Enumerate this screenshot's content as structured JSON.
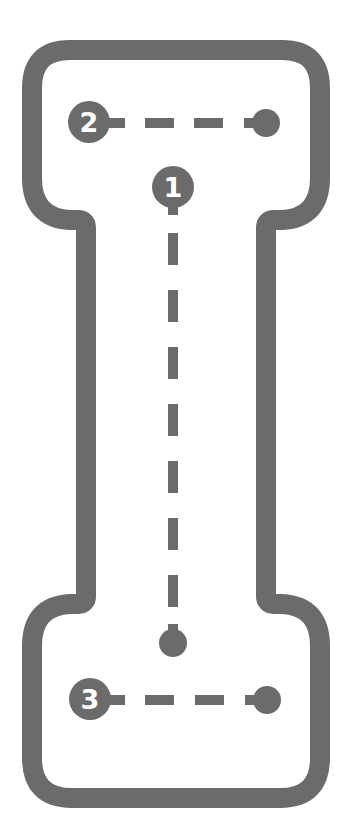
{
  "worksheet": {
    "letter": "I",
    "colors": {
      "outline": "#6b6b6b",
      "guide": "#6b6b6b",
      "marker_text": "#ffffff",
      "background": "#ffffff"
    },
    "strokes": [
      {
        "order": "1",
        "direction": "top-to-bottom",
        "label": "1"
      },
      {
        "order": "2",
        "direction": "left-to-right",
        "label": "2"
      },
      {
        "order": "3",
        "direction": "left-to-right",
        "label": "3"
      }
    ]
  }
}
